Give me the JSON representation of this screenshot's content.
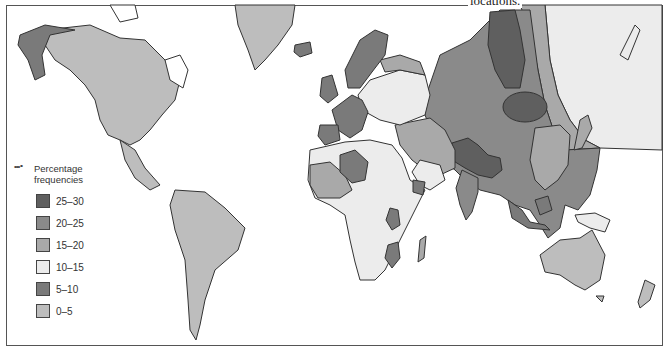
{
  "caption": "locations.",
  "legend": {
    "title_line1": "Percentage",
    "title_line2": "frequencies",
    "dots_icon": "•••∘",
    "items": [
      {
        "label": "25–30",
        "color": "#5f5f5f"
      },
      {
        "label": "20–25",
        "color": "#8a8a8a"
      },
      {
        "label": "15–20",
        "color": "#a9a9a9"
      },
      {
        "label": "10–15",
        "color": "#ececec"
      },
      {
        "label": "5–10",
        "color": "#7a7a7a"
      },
      {
        "label": "0–5",
        "color": "#bdbdbd"
      }
    ]
  },
  "map": {
    "ocean_color": "#ffffff",
    "border_color": "#333333",
    "regions": [
      {
        "name": "North America",
        "class": "0-5"
      },
      {
        "name": "Alaska",
        "class": "5-10"
      },
      {
        "name": "Greenland",
        "class": "0-5"
      },
      {
        "name": "Iceland",
        "class": "5-10"
      },
      {
        "name": "Central America",
        "class": "0-5"
      },
      {
        "name": "South America",
        "class": "0-5"
      },
      {
        "name": "Western Europe",
        "class": "5-10"
      },
      {
        "name": "Scandinavia",
        "class": "5-10"
      },
      {
        "name": "Eastern Europe",
        "class": "10-15"
      },
      {
        "name": "Russia / Central Asia",
        "class": "20-25"
      },
      {
        "name": "Northern Siberia",
        "class": "10-15"
      },
      {
        "name": "Central Siberia core",
        "class": "25-30"
      },
      {
        "name": "Mongolia core",
        "class": "25-30"
      },
      {
        "name": "Tibet / Himalaya",
        "class": "25-30"
      },
      {
        "name": "Middle East",
        "class": "15-20"
      },
      {
        "name": "North Africa",
        "class": "10-15"
      },
      {
        "name": "Sahara core",
        "class": "5-10"
      },
      {
        "name": "West Africa",
        "class": "15-20"
      },
      {
        "name": "Central Africa",
        "class": "10-15"
      },
      {
        "name": "Southeast Asia",
        "class": "20-25"
      },
      {
        "name": "Indonesia",
        "class": "5-10"
      },
      {
        "name": "New Guinea",
        "class": "10-15"
      },
      {
        "name": "Australia",
        "class": "0-5"
      },
      {
        "name": "New Zealand",
        "class": "0-5"
      }
    ]
  }
}
